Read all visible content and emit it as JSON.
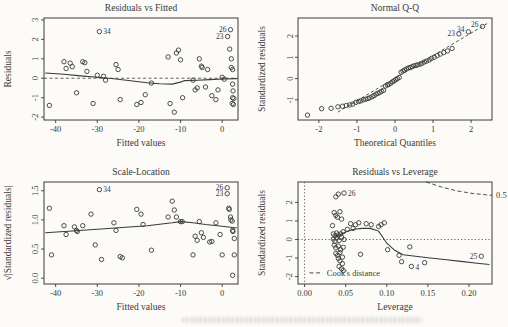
{
  "colors": {
    "ink": "#3a3a3a",
    "background": "#fcfbf7"
  },
  "chart_data": [
    {
      "type": "scatter",
      "title": "Residuals vs Fitted",
      "xlabel": "Fitted values",
      "ylabel": "Residuals",
      "xlim": [
        -42.8,
        3.8
      ],
      "ylim": [
        -2.15,
        3.1
      ],
      "xticks": {
        "values": [
          -40,
          -30,
          -20,
          -10,
          0
        ],
        "labels": [
          "-40",
          "-30",
          "-20",
          "-10",
          "0"
        ]
      },
      "yticks": {
        "values": [
          -2,
          -1,
          0,
          1,
          2,
          3
        ],
        "labels": [
          "-2",
          "-1",
          "0",
          "1",
          "2",
          "3"
        ]
      },
      "hlines_dashed": [
        0
      ],
      "smooth": [
        [
          -42.5,
          0.27
        ],
        [
          -38,
          0.2
        ],
        [
          -34,
          0.12
        ],
        [
          -30,
          0.05
        ],
        [
          -26,
          -0.03
        ],
        [
          -22,
          -0.13
        ],
        [
          -18,
          -0.23
        ],
        [
          -15,
          -0.28
        ],
        [
          -12,
          -0.3
        ],
        [
          -10,
          -0.2
        ],
        [
          -9,
          -0.12
        ],
        [
          -6,
          -0.1
        ],
        [
          -3,
          -0.07
        ],
        [
          0,
          -0.04
        ],
        [
          3.5,
          -0.02
        ]
      ],
      "points": [
        [
          -41.5,
          -1.4
        ],
        [
          -38,
          0.85
        ],
        [
          -37.5,
          0.5
        ],
        [
          -36.5,
          0.78
        ],
        [
          -36,
          0.6
        ],
        [
          -35,
          -0.75
        ],
        [
          -33.5,
          0.85
        ],
        [
          -33,
          0.8
        ],
        [
          -32.5,
          0.35
        ],
        [
          -31,
          -1.3
        ],
        [
          -30,
          0.15
        ],
        [
          -29.5,
          2.4
        ],
        [
          -28.5,
          0.1
        ],
        [
          -28,
          -0.1
        ],
        [
          -25.5,
          0.7
        ],
        [
          -25,
          0.45
        ],
        [
          -24.5,
          -1.1
        ],
        [
          -20.5,
          -1.35
        ],
        [
          -19.5,
          -1.25
        ],
        [
          -18.5,
          -0.85
        ],
        [
          -17,
          -0.25
        ],
        [
          -13,
          1.1
        ],
        [
          -12.5,
          -1.3
        ],
        [
          -11.5,
          -1.75
        ],
        [
          -11,
          1.3
        ],
        [
          -10.5,
          1.45
        ],
        [
          -10,
          0.95
        ],
        [
          -9.5,
          -1.0
        ],
        [
          -7,
          -0.1
        ],
        [
          -6.5,
          -0.6
        ],
        [
          -6,
          -0.5
        ],
        [
          -5.5,
          1.0
        ],
        [
          -5,
          0.62
        ],
        [
          -4.8,
          0.55
        ],
        [
          -4,
          -0.45
        ],
        [
          -3.5,
          0.45
        ],
        [
          -2.5,
          -0.9
        ],
        [
          -1.5,
          -1.1
        ],
        [
          -1,
          -0.6
        ],
        [
          0,
          0.05
        ],
        [
          0.5,
          -0.05
        ],
        [
          1.3,
          2.15
        ],
        [
          2,
          2.5
        ],
        [
          1.8,
          1.5
        ],
        [
          2.2,
          1.0
        ],
        [
          2.2,
          0.55
        ],
        [
          2.5,
          0.45
        ],
        [
          2.5,
          -0.3
        ],
        [
          2.6,
          -0.65
        ],
        [
          2.5,
          -1.0
        ],
        [
          2.8,
          -1.05
        ],
        [
          2.7,
          -1.35
        ],
        [
          2.4,
          -1.3
        ]
      ],
      "point_labels": [
        {
          "text": "34",
          "x": -29.5,
          "y": 2.4,
          "side": "right"
        },
        {
          "text": "26",
          "x": 2.0,
          "y": 2.5,
          "side": "left"
        },
        {
          "text": "23",
          "x": 1.3,
          "y": 2.15,
          "side": "left"
        }
      ]
    },
    {
      "type": "scatter",
      "title": "Normal Q-Q",
      "xlabel": "Theoretical Quantiles",
      "ylabel": "Standardized residuals",
      "xlim": [
        -2.55,
        2.55
      ],
      "ylim": [
        -1.95,
        2.85
      ],
      "xticks": {
        "values": [
          -2,
          -1,
          0,
          1,
          2
        ],
        "labels": [
          "-2",
          "-1",
          "0",
          "1",
          "2"
        ]
      },
      "yticks": {
        "values": [
          -1,
          0,
          1,
          2
        ],
        "labels": [
          "-1",
          "0",
          "1",
          "2"
        ]
      },
      "ref_line_dashed": [
        [
          -1.5,
          -1.58
        ],
        [
          2.45,
          2.62
        ]
      ],
      "points": [
        [
          -2.3,
          -1.72
        ],
        [
          -1.93,
          -1.42
        ],
        [
          -1.68,
          -1.4
        ],
        [
          -1.5,
          -1.33
        ],
        [
          -1.38,
          -1.3
        ],
        [
          -1.28,
          -1.27
        ],
        [
          -1.19,
          -1.24
        ],
        [
          -1.11,
          -1.2
        ],
        [
          -1.03,
          -1.12
        ],
        [
          -0.96,
          -1.08
        ],
        [
          -0.9,
          -1.05
        ],
        [
          -0.83,
          -1.0
        ],
        [
          -0.77,
          -0.97
        ],
        [
          -0.71,
          -0.94
        ],
        [
          -0.66,
          -0.9
        ],
        [
          -0.6,
          -0.85
        ],
        [
          -0.55,
          -0.8
        ],
        [
          -0.5,
          -0.73
        ],
        [
          -0.45,
          -0.7
        ],
        [
          -0.4,
          -0.65
        ],
        [
          -0.35,
          -0.6
        ],
        [
          -0.3,
          -0.55
        ],
        [
          -0.25,
          -0.35
        ],
        [
          -0.2,
          -0.3
        ],
        [
          -0.16,
          -0.27
        ],
        [
          -0.11,
          -0.22
        ],
        [
          -0.06,
          -0.15
        ],
        [
          -0.02,
          -0.1
        ],
        [
          0.02,
          -0.05
        ],
        [
          0.06,
          0.0
        ],
        [
          0.11,
          0.05
        ],
        [
          0.16,
          0.3
        ],
        [
          0.21,
          0.35
        ],
        [
          0.25,
          0.4
        ],
        [
          0.3,
          0.45
        ],
        [
          0.35,
          0.5
        ],
        [
          0.4,
          0.52
        ],
        [
          0.45,
          0.56
        ],
        [
          0.5,
          0.6
        ],
        [
          0.55,
          0.62
        ],
        [
          0.6,
          0.65
        ],
        [
          0.66,
          0.68
        ],
        [
          0.71,
          0.72
        ],
        [
          0.77,
          0.78
        ],
        [
          0.83,
          0.82
        ],
        [
          0.9,
          0.88
        ],
        [
          0.96,
          0.95
        ],
        [
          1.03,
          1.0
        ],
        [
          1.11,
          1.08
        ],
        [
          1.19,
          1.15
        ],
        [
          1.28,
          1.22
        ],
        [
          1.38,
          1.3
        ],
        [
          1.5,
          1.42
        ],
        [
          1.68,
          2.1
        ],
        [
          1.93,
          2.2
        ],
        [
          2.3,
          2.45
        ]
      ],
      "point_labels": [
        {
          "text": "23",
          "x": 1.68,
          "y": 2.1,
          "side": "left"
        },
        {
          "text": "34",
          "x": 1.93,
          "y": 2.2,
          "side": "left",
          "dy": 0
        },
        {
          "text": "26",
          "x": 2.3,
          "y": 2.45,
          "side": "left",
          "dy": 0
        }
      ]
    },
    {
      "type": "scatter",
      "title": "Scale-Location",
      "xlabel": "Fitted values",
      "ylabel": "√|Standardized residuals|",
      "xlim": [
        -42.8,
        3.8
      ],
      "ylim": [
        -0.1,
        1.65
      ],
      "xticks": {
        "values": [
          -40,
          -30,
          -20,
          -10,
          0
        ],
        "labels": [
          "-40",
          "-30",
          "-20",
          "-10",
          "0"
        ]
      },
      "yticks": {
        "values": [
          0,
          0.5,
          1,
          1.5
        ],
        "labels": [
          "0.0",
          "0.5",
          "1.0",
          "1.5"
        ]
      },
      "smooth": [
        [
          -42.5,
          0.78
        ],
        [
          -36,
          0.81
        ],
        [
          -30,
          0.84
        ],
        [
          -24,
          0.87
        ],
        [
          -18,
          0.9
        ],
        [
          -12,
          0.95
        ],
        [
          -10,
          0.97
        ],
        [
          -7,
          0.95
        ],
        [
          -4,
          0.92
        ],
        [
          0,
          0.89
        ],
        [
          3.5,
          0.86
        ]
      ],
      "points": [
        [
          -41.5,
          1.2
        ],
        [
          -41,
          0.4
        ],
        [
          -38,
          0.9
        ],
        [
          -37.5,
          0.75
        ],
        [
          -35.5,
          0.88
        ],
        [
          -35,
          0.82
        ],
        [
          -34.8,
          0.8
        ],
        [
          -33.5,
          0.9
        ],
        [
          -31.5,
          1.1
        ],
        [
          -30.5,
          0.57
        ],
        [
          -29.5,
          1.52
        ],
        [
          -29,
          0.32
        ],
        [
          -26,
          0.95
        ],
        [
          -25.5,
          0.82
        ],
        [
          -24.5,
          0.37
        ],
        [
          -24,
          0.35
        ],
        [
          -20.5,
          1.18
        ],
        [
          -19.5,
          1.1
        ],
        [
          -19,
          0.92
        ],
        [
          -17,
          0.48
        ],
        [
          -13,
          1.05
        ],
        [
          -12,
          1.32
        ],
        [
          -11.5,
          1.17
        ],
        [
          -11,
          1.05
        ],
        [
          -10,
          0.97
        ],
        [
          -9.6,
          0.97
        ],
        [
          -7,
          0.4
        ],
        [
          -6.5,
          0.72
        ],
        [
          -6,
          0.65
        ],
        [
          -5.5,
          0.97
        ],
        [
          -5,
          0.78
        ],
        [
          -4.5,
          0.7
        ],
        [
          -3,
          0.62
        ],
        [
          -2.5,
          0.63
        ],
        [
          -1.5,
          0.95
        ],
        [
          -0.5,
          0.75
        ],
        [
          0,
          0.4
        ],
        [
          1.2,
          1.55
        ],
        [
          1.2,
          1.45
        ],
        [
          1.6,
          1.2
        ],
        [
          1.7,
          1.18
        ],
        [
          2,
          1.05
        ],
        [
          2.1,
          1.0
        ],
        [
          2.4,
          0.98
        ],
        [
          2.5,
          0.82
        ],
        [
          2.6,
          0.8
        ],
        [
          2.9,
          0.68
        ],
        [
          2.9,
          0.4
        ],
        [
          2.5,
          0.05
        ]
      ],
      "point_labels": [
        {
          "text": "34",
          "x": -29.5,
          "y": 1.52,
          "side": "right"
        },
        {
          "text": "26",
          "x": 1.2,
          "y": 1.55,
          "side": "left"
        },
        {
          "text": "23",
          "x": 1.2,
          "y": 1.45,
          "side": "left"
        }
      ]
    },
    {
      "type": "scatter",
      "title": "Residuals vs Leverage",
      "xlabel": "Leverage",
      "ylabel": "Standardized residuals",
      "xlim": [
        -0.008,
        0.228
      ],
      "ylim": [
        -2.4,
        3.1
      ],
      "xticks": {
        "values": [
          0,
          0.05,
          0.1,
          0.15,
          0.2
        ],
        "labels": [
          "0.00",
          "0.05",
          "0.10",
          "0.15",
          "0.20"
        ]
      },
      "yticks": {
        "values": [
          -2,
          -1,
          0,
          1,
          2
        ],
        "labels": [
          "-2",
          "-1",
          "0",
          "1",
          "2"
        ]
      },
      "hlines_dotted": [
        0
      ],
      "vlines_dotted": [
        0
      ],
      "contour_dashed": [
        [
          0.148,
          3.1
        ],
        [
          0.165,
          2.85
        ],
        [
          0.185,
          2.62
        ],
        [
          0.205,
          2.48
        ],
        [
          0.228,
          2.38
        ]
      ],
      "contour_label": "0.5",
      "legend": {
        "text": "Cook's distance",
        "line": [
          [
            0.006,
            -1.8
          ],
          [
            0.022,
            -1.8
          ]
        ],
        "text_at": [
          0.027,
          -1.8
        ]
      },
      "smooth": [
        [
          0.036,
          0.1
        ],
        [
          0.05,
          0.4
        ],
        [
          0.06,
          0.55
        ],
        [
          0.07,
          0.6
        ],
        [
          0.08,
          0.6
        ],
        [
          0.09,
          0.45
        ],
        [
          0.1,
          -0.2
        ],
        [
          0.11,
          -0.6
        ],
        [
          0.12,
          -0.82
        ],
        [
          0.13,
          -0.88
        ],
        [
          0.15,
          -0.98
        ],
        [
          0.17,
          -1.08
        ],
        [
          0.19,
          -1.18
        ],
        [
          0.21,
          -1.28
        ],
        [
          0.225,
          -1.35
        ]
      ],
      "points": [
        [
          0.034,
          0.75
        ],
        [
          0.036,
          1.45
        ],
        [
          0.038,
          1.3
        ],
        [
          0.04,
          1.2
        ],
        [
          0.043,
          1.5
        ],
        [
          0.045,
          1.1
        ],
        [
          0.038,
          2.3
        ],
        [
          0.041,
          2.45
        ],
        [
          0.048,
          2.5
        ],
        [
          0.035,
          0.3
        ],
        [
          0.037,
          0.2
        ],
        [
          0.039,
          0.35
        ],
        [
          0.041,
          0.25
        ],
        [
          0.044,
          0.3
        ],
        [
          0.047,
          0.42
        ],
        [
          0.035,
          0.02
        ],
        [
          0.037,
          -0.1
        ],
        [
          0.039,
          0.08
        ],
        [
          0.042,
          -0.05
        ],
        [
          0.045,
          0.12
        ],
        [
          0.048,
          0.0
        ],
        [
          0.036,
          -0.3
        ],
        [
          0.038,
          -0.45
        ],
        [
          0.041,
          -0.35
        ],
        [
          0.044,
          -0.55
        ],
        [
          0.047,
          -0.42
        ],
        [
          0.038,
          -0.75
        ],
        [
          0.04,
          -0.85
        ],
        [
          0.043,
          -0.7
        ],
        [
          0.046,
          -0.95
        ],
        [
          0.041,
          -1.02
        ],
        [
          0.043,
          -1.15
        ],
        [
          0.046,
          -1.3
        ],
        [
          0.042,
          -1.45
        ],
        [
          0.045,
          -1.58
        ],
        [
          0.047,
          -1.68
        ],
        [
          0.052,
          0.55
        ],
        [
          0.056,
          0.85
        ],
        [
          0.059,
          0.6
        ],
        [
          0.062,
          0.8
        ],
        [
          0.066,
          0.9
        ],
        [
          0.075,
          0.85
        ],
        [
          0.081,
          0.8
        ],
        [
          0.068,
          -0.8
        ],
        [
          0.09,
          0.7
        ],
        [
          0.093,
          0.8
        ],
        [
          0.097,
          0.9
        ],
        [
          0.101,
          -0.55
        ],
        [
          0.115,
          -0.85
        ],
        [
          0.118,
          -1.2
        ],
        [
          0.128,
          -0.4
        ],
        [
          0.13,
          -1.45
        ],
        [
          0.146,
          -1.25
        ],
        [
          0.215,
          -0.9
        ]
      ],
      "point_labels": [
        {
          "text": "26",
          "x": 0.048,
          "y": 2.5,
          "side": "right"
        },
        {
          "text": "4",
          "x": 0.13,
          "y": -1.45,
          "side": "right",
          "dy": 4
        },
        {
          "text": "25",
          "x": 0.215,
          "y": -0.9,
          "side": "left"
        }
      ]
    }
  ]
}
